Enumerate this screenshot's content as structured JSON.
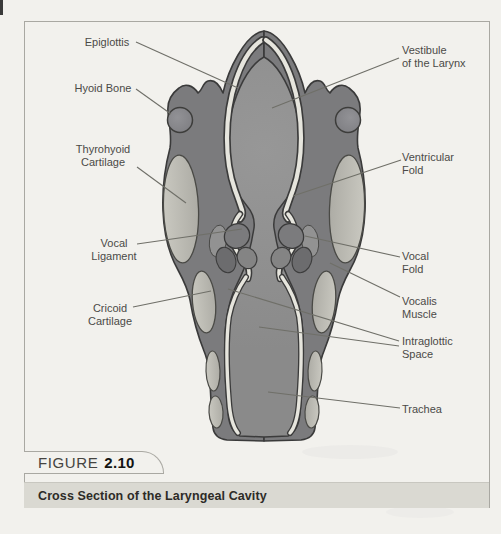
{
  "figure": {
    "tab_label_word": "FIGURE",
    "tab_label_number": "2.10",
    "caption": "Cross Section of the Laryngeal Cavity"
  },
  "labels": {
    "left": [
      {
        "id": "epiglottis",
        "lines": [
          "Epiglottis"
        ]
      },
      {
        "id": "hyoid-bone",
        "lines": [
          "Hyoid Bone"
        ]
      },
      {
        "id": "thyrohyoid-cartilage",
        "lines": [
          "Thyrohyoid",
          "Cartilage"
        ]
      },
      {
        "id": "vocal-ligament",
        "lines": [
          "Vocal",
          "Ligament"
        ]
      },
      {
        "id": "cricoid-cartilage",
        "lines": [
          "Cricoid",
          "Cartilage"
        ]
      }
    ],
    "right": [
      {
        "id": "vestibule-of-the-larynx",
        "lines": [
          "Vestibule",
          "of the Larynx"
        ]
      },
      {
        "id": "ventricular-fold",
        "lines": [
          "Ventricular",
          "Fold"
        ]
      },
      {
        "id": "vocal-fold",
        "lines": [
          "Vocal",
          "Fold"
        ]
      },
      {
        "id": "vocalis-muscle",
        "lines": [
          "Vocalis",
          "Muscle"
        ]
      },
      {
        "id": "intraglottic-space",
        "lines": [
          "Intraglottic",
          "Space"
        ]
      },
      {
        "id": "trachea",
        "lines": [
          "Trachea"
        ]
      }
    ]
  },
  "colors": {
    "page_background": "#f2f1ed",
    "frame_border": "#a9a8a2",
    "caption_band": "#dad9d2",
    "caption_text": "#2d2b27",
    "label_text": "#4b4a47",
    "tissue_dark_gray": "#7b7b7d",
    "cavity_gray": "#8f8f8f",
    "cartilage_light": "#bcbbb3",
    "lining_cream": "#e6e5dd",
    "outline": "#3a3a3a"
  }
}
